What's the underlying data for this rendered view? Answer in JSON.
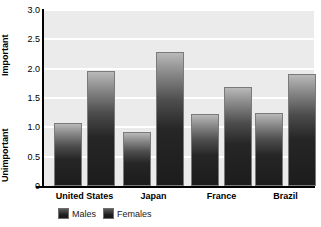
{
  "chart_data": {
    "type": "bar",
    "title": "",
    "subtitle": "",
    "xlabel": "",
    "ylabel": "",
    "ylim": [
      0,
      3.0
    ],
    "ytick_values": [
      0,
      0.5,
      1.0,
      1.5,
      2.0,
      2.5,
      3.0
    ],
    "ytick_labels": [
      "0",
      "0.5",
      "1.0",
      "1.5",
      "2.0",
      "2.5",
      "3.0"
    ],
    "y_axis_top_label": "Important",
    "y_axis_bottom_label": "Unimportant",
    "grid": true,
    "grid_axis": "y",
    "legend_position": "bottom-left",
    "categories": [
      "United States",
      "Japan",
      "France",
      "Brazil"
    ],
    "series": [
      {
        "name": "Males",
        "values": [
          1.07,
          0.92,
          1.22,
          1.25
        ]
      },
      {
        "name": "Females",
        "values": [
          1.96,
          2.29,
          1.68,
          1.91
        ]
      }
    ]
  },
  "legend": {
    "items": [
      {
        "label": "Males"
      },
      {
        "label": "Females"
      }
    ]
  },
  "colors": {
    "plot_background": "#ebebeb",
    "gridline": "#ffffff",
    "axis": "#000000",
    "bar_top": "#b9b9b9",
    "bar_bottom": "#1c1c1c",
    "bar_border": "#7a7a7a",
    "text": "#000000"
  }
}
